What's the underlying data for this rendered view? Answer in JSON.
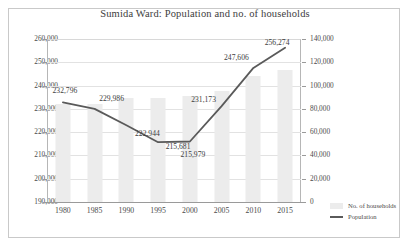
{
  "chart_data": {
    "type": "bar",
    "title": "Sumida Ward: Population and no. of households",
    "xlabel": "",
    "categories": [
      "1980",
      "1985",
      "1990",
      "1995",
      "2000",
      "2005",
      "2010",
      "2015"
    ],
    "grid": true,
    "legend_position": "bottom-right",
    "series": [
      {
        "name": "No. of households",
        "type": "bar",
        "axis": "right",
        "ylabel": "No. of households",
        "ylim": [
          0,
          140000
        ],
        "yticks": [
          "0",
          "20,000",
          "40,000",
          "60,000",
          "80,000",
          "100,000",
          "120,000",
          "140,000"
        ],
        "values": [
          84000,
          84000,
          89000,
          89500,
          91000,
          95000,
          108000,
          113000
        ]
      },
      {
        "name": "Population",
        "type": "line",
        "axis": "left",
        "ylabel": "Population",
        "ylim": [
          190000,
          260000
        ],
        "yticks": [
          "190,000",
          "200,000",
          "210,000",
          "220,000",
          "230,000",
          "240,000",
          "250,000",
          "260,000"
        ],
        "values": [
          232796,
          229986,
          222944,
          215681,
          215979,
          231173,
          247606,
          256274
        ],
        "labels": [
          "232,796",
          "229,986",
          "222,944",
          "215,681",
          "215,979",
          "231,173",
          "247,606",
          "256,274"
        ]
      }
    ]
  },
  "legend": {
    "households_label": "No. of households",
    "population_label": "Population"
  },
  "colors": {
    "bar": "#ececec",
    "line": "#5a5a5a",
    "grid": "#e2e2e2",
    "axis": "#9a9a9a",
    "text": "#3d3d3d",
    "frame": "#c9c9c9"
  }
}
